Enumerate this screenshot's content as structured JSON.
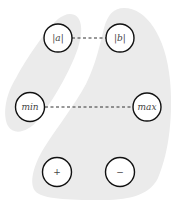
{
  "diagram": {
    "colors": {
      "region_fill": "#ebebeb",
      "node_fill": "#ffffff",
      "node_stroke": "#111111",
      "edge_stroke": "#333333",
      "label": "#444444"
    },
    "regions": [
      {
        "id": "left-region",
        "contains": [
          "|a|",
          "min"
        ]
      },
      {
        "id": "right-region",
        "contains": [
          "|b|",
          "max",
          "+",
          "−"
        ]
      }
    ],
    "nodes": [
      {
        "id": "abs-a",
        "label": "|a|",
        "cx": 58,
        "cy": 38
      },
      {
        "id": "abs-b",
        "label": "|b|",
        "cx": 120,
        "cy": 38
      },
      {
        "id": "min",
        "label": "min",
        "cx": 30,
        "cy": 107
      },
      {
        "id": "max",
        "label": "max",
        "cx": 147,
        "cy": 107
      },
      {
        "id": "plus",
        "label": "+",
        "cx": 57,
        "cy": 172
      },
      {
        "id": "minus",
        "label": "−",
        "cx": 120,
        "cy": 172
      }
    ],
    "edges": [
      {
        "from": "|a|",
        "to": "|b|",
        "style": "dashed"
      },
      {
        "from": "min",
        "to": "max",
        "style": "dashed"
      }
    ]
  }
}
